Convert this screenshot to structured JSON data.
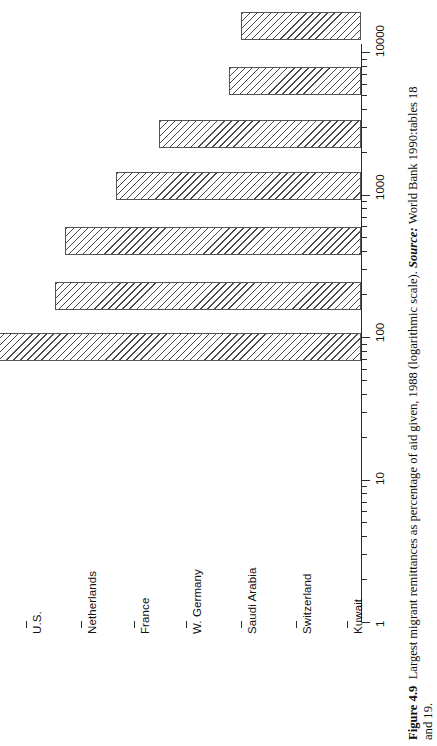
{
  "figure": {
    "number_label": "Figure 4.9",
    "caption_line1": "Largest migrant remittances as percentage of aid given, 1988 (logarithmic scale).",
    "source_label": "Source:",
    "source_text": "World Bank 1990:tables 18",
    "caption_line2": "and 19."
  },
  "chart_data": {
    "type": "bar",
    "orientation": "vertical",
    "title": "Largest migrant remittances as percentage of aid given, 1988 (logarithmic scale)",
    "xlabel": "",
    "ylabel": "",
    "scale": "log",
    "grid": false,
    "legend": null,
    "categories": [
      "U.S.",
      "Netherlands",
      "France",
      "W. Germany",
      "Saudi Arabia",
      "Switzerland",
      "Kuwait"
    ],
    "values": [
      7.0,
      8.5,
      26,
      52,
      120,
      140,
      580
    ],
    "ylim": [
      1,
      10000
    ],
    "ytick_labels": [
      "1",
      "10",
      "100",
      "1000",
      "10000"
    ],
    "ytick_values": [
      1,
      10,
      100,
      1000,
      10000
    ],
    "bar_color": "#ffffff",
    "bar_edge_color": "#555555",
    "bar_hatch": "diagonal-lines"
  }
}
